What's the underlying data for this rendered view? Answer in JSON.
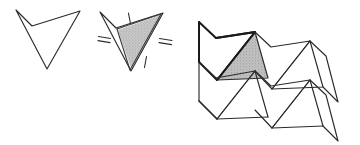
{
  "figure": {
    "background_color": "#ffffff",
    "width": 360,
    "height": 145,
    "stroke_color": "#2b2b2b",
    "bold_stroke_color": "#1a1a1a",
    "shade_fill_color": "#b9b9b9",
    "shade_fill_color_light": "#c4c4c4",
    "tick_color": "#2b2b2b"
  },
  "panels": [
    {
      "id": "panel-dart-outline",
      "caption": "",
      "description": "Plain dart shaped quadrilateral outline",
      "vertices": [
        {
          "name": "top-left",
          "x": 16,
          "y": 10
        },
        {
          "name": "notch",
          "x": 32,
          "y": 26
        },
        {
          "name": "top-right",
          "x": 80,
          "y": 11
        },
        {
          "name": "bottom",
          "x": 47,
          "y": 69
        }
      ]
    },
    {
      "id": "panel-dart-dissected",
      "caption": "",
      "description": "Dart quadrilateral split by a diagonal with one triangle shaded and congruence tick marks",
      "vertices": [
        {
          "name": "top-left",
          "x": 100,
          "y": 12
        },
        {
          "name": "notch",
          "x": 116,
          "y": 28
        },
        {
          "name": "top-right",
          "x": 163,
          "y": 13
        },
        {
          "name": "bottom",
          "x": 131,
          "y": 71
        }
      ],
      "shaded_triangle": [
        {
          "name": "notch",
          "x": 117,
          "y": 29
        },
        {
          "name": "top-right",
          "x": 162,
          "y": 15
        },
        {
          "name": "bottom",
          "x": 131,
          "y": 70
        }
      ],
      "tick_marks": [
        {
          "name": "tick-top-edge",
          "count": 1,
          "x": 129,
          "y": 18
        },
        {
          "name": "tick-left-edge",
          "count": 2,
          "x": 104,
          "y": 39
        },
        {
          "name": "tick-right-edge",
          "count": 2,
          "x": 165,
          "y": 41
        },
        {
          "name": "tick-bottom-edge",
          "count": 1,
          "x": 146,
          "y": 62
        }
      ]
    },
    {
      "id": "panel-tessellation",
      "caption": "",
      "description": "Tessellation of the dart quadrilateral forming a zig-zag strip pattern with one triangle shaded",
      "shaded_triangle": [
        {
          "name": "left",
          "x": 217,
          "y": 80
        },
        {
          "name": "apex",
          "x": 255,
          "y": 32
        },
        {
          "name": "right",
          "x": 268,
          "y": 78
        }
      ],
      "columns": 3,
      "rows": 2
    }
  ],
  "geometry_notes": {
    "shape_name": "dart",
    "shape_kind": "non-convex quadrilateral",
    "tessellation_type": "translation strip"
  }
}
